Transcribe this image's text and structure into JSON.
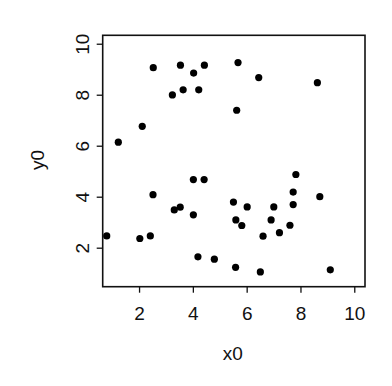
{
  "chart_data": {
    "type": "scatter",
    "title": "",
    "xlabel": "x0",
    "ylabel": "y0",
    "xlim": [
      0.63,
      10.38
    ],
    "ylim": [
      0.49,
      10.35
    ],
    "xticks": [
      2,
      4,
      6,
      8,
      10
    ],
    "yticks": [
      2,
      4,
      6,
      8,
      10
    ],
    "grid": false,
    "legend": null,
    "marker": {
      "shape": "circle",
      "filled": true,
      "color": "#000000"
    },
    "series": [
      {
        "name": "points",
        "x": [
          2.51,
          3.52,
          4.41,
          4.01,
          3.62,
          4.2,
          3.22,
          2.1,
          5.66,
          6.43,
          8.61,
          5.61,
          1.21,
          2.5,
          4.0,
          4.4,
          3.29,
          3.51,
          4.0,
          5.49,
          5.58,
          5.8,
          6.0,
          6.59,
          6.89,
          6.99,
          7.2,
          7.59,
          7.71,
          7.71,
          7.81,
          8.7,
          0.78,
          2.01,
          2.4,
          4.17,
          4.78,
          5.57,
          6.49,
          9.09
        ],
        "y": [
          9.08,
          9.18,
          9.18,
          8.87,
          8.21,
          8.21,
          8.01,
          6.78,
          9.28,
          8.69,
          8.49,
          7.41,
          6.16,
          4.1,
          4.69,
          4.69,
          3.5,
          3.61,
          3.31,
          3.81,
          3.11,
          2.89,
          3.62,
          2.47,
          3.11,
          3.62,
          2.61,
          2.9,
          3.71,
          4.2,
          4.89,
          4.02,
          2.48,
          2.38,
          2.48,
          1.66,
          1.57,
          1.25,
          1.07,
          1.15
        ]
      }
    ]
  },
  "axes": {
    "x_label": "x0",
    "y_label": "y0",
    "x_tick_labels": [
      "2",
      "4",
      "6",
      "8",
      "10"
    ],
    "y_tick_labels": [
      "2",
      "4",
      "6",
      "8",
      "10"
    ]
  },
  "colors": {
    "ink": "#111111",
    "background": "#ffffff"
  }
}
